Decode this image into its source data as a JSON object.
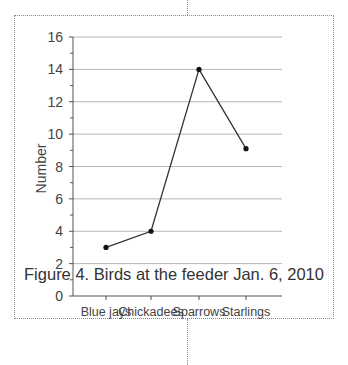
{
  "chart_data": {
    "type": "line",
    "title": "",
    "caption": "Figure 4. Birds at the feeder Jan. 6, 2010",
    "xlabel": "",
    "ylabel": "Number",
    "categories": [
      "Blue jays",
      "Chickadees",
      "Sparrows",
      "Starlings"
    ],
    "series": [
      {
        "name": "Birds",
        "values": [
          3,
          4,
          14,
          9.1
        ],
        "marker": "circle",
        "color": "#333333"
      }
    ],
    "ylim": [
      0,
      16
    ],
    "yticks": [
      0,
      2,
      4,
      6,
      8,
      10,
      12,
      14,
      16
    ],
    "grid": true,
    "legend": null
  },
  "figure": {
    "caption": "Figure 4. Birds at the feeder Jan. 6, 2010",
    "ylabel": "Number"
  }
}
